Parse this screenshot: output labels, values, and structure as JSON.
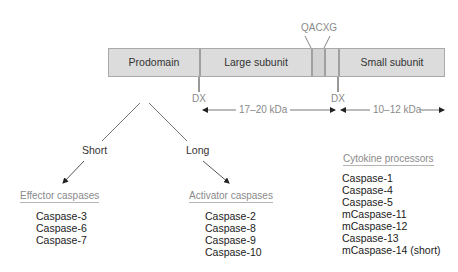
{
  "domain_bar": {
    "segments": [
      {
        "label": "Prodomain"
      },
      {
        "label": "Large subunit"
      },
      {
        "label": ""
      },
      {
        "label": ""
      },
      {
        "label": "Small subunit"
      }
    ],
    "motif_label": "QACXG",
    "cleavage_site_1": "DX",
    "cleavage_site_2": "DX",
    "large_subunit_size": "17–20 kDa",
    "small_subunit_size": "10–12 kDa",
    "fill_color": "#dcdcdc",
    "border_color": "#a9a9a9"
  },
  "tree": {
    "short_label": "Short",
    "long_label": "Long"
  },
  "groups": {
    "effector": {
      "title": "Effector caspases",
      "items": [
        "Caspase-3",
        "Caspase-6",
        "Caspase-7"
      ]
    },
    "activator": {
      "title": "Activator caspases",
      "items": [
        "Caspase-2",
        "Caspase-8",
        "Caspase-9",
        "Caspase-10"
      ]
    },
    "cytokine": {
      "title": "Cytokine processors",
      "items": [
        "Caspase-1",
        "Caspase-4",
        "Caspase-5",
        "mCaspase-11",
        "mCaspase-12",
        "Caspase-13",
        "mCaspase-14 (short)"
      ]
    }
  }
}
